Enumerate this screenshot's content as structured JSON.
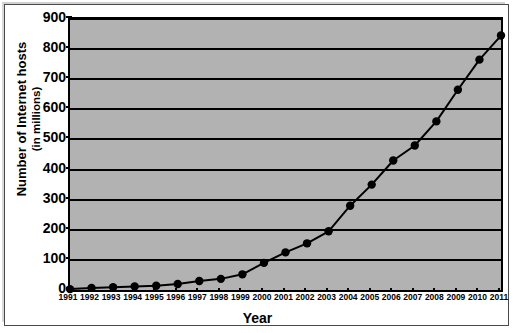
{
  "chart_data": {
    "type": "line",
    "title": "",
    "xlabel": "Year",
    "ylabel": "Number of Internet hosts",
    "ylabel_line2": "(in millions)",
    "categories": [
      "1991",
      "1992",
      "1993",
      "1994",
      "1995",
      "1996",
      "1997",
      "1998",
      "1999",
      "2000",
      "2001",
      "2002",
      "2003",
      "2004",
      "2005",
      "2006",
      "2007",
      "2008",
      "2009",
      "2010",
      "2011"
    ],
    "values": [
      3,
      7,
      9,
      12,
      14,
      20,
      30,
      37,
      52,
      90,
      125,
      155,
      195,
      280,
      350,
      430,
      480,
      560,
      665,
      765,
      845
    ],
    "series": [
      {
        "name": "Number of Internet hosts (in millions)",
        "values": [
          3,
          7,
          9,
          12,
          14,
          20,
          30,
          37,
          52,
          90,
          125,
          155,
          195,
          280,
          350,
          430,
          480,
          560,
          665,
          765,
          845
        ]
      }
    ],
    "ylim": [
      0,
      900
    ],
    "yticks": [
      0,
      100,
      200,
      300,
      400,
      500,
      600,
      700,
      800,
      900
    ],
    "ytick_labels": [
      "0",
      "100",
      "200",
      "300",
      "400",
      "500",
      "600",
      "700",
      "800",
      "900"
    ],
    "xlim": [
      "1991",
      "2011"
    ],
    "grid": "horizontal",
    "legend": "none",
    "marker": "filled-circle",
    "colors": {
      "plot_background": "#b2b2b2",
      "line": "#000000",
      "marker": "#000000",
      "gridline": "#000000",
      "axis": "#000000",
      "page_background": "#ffffff",
      "frame": "#4a4a4a"
    }
  }
}
